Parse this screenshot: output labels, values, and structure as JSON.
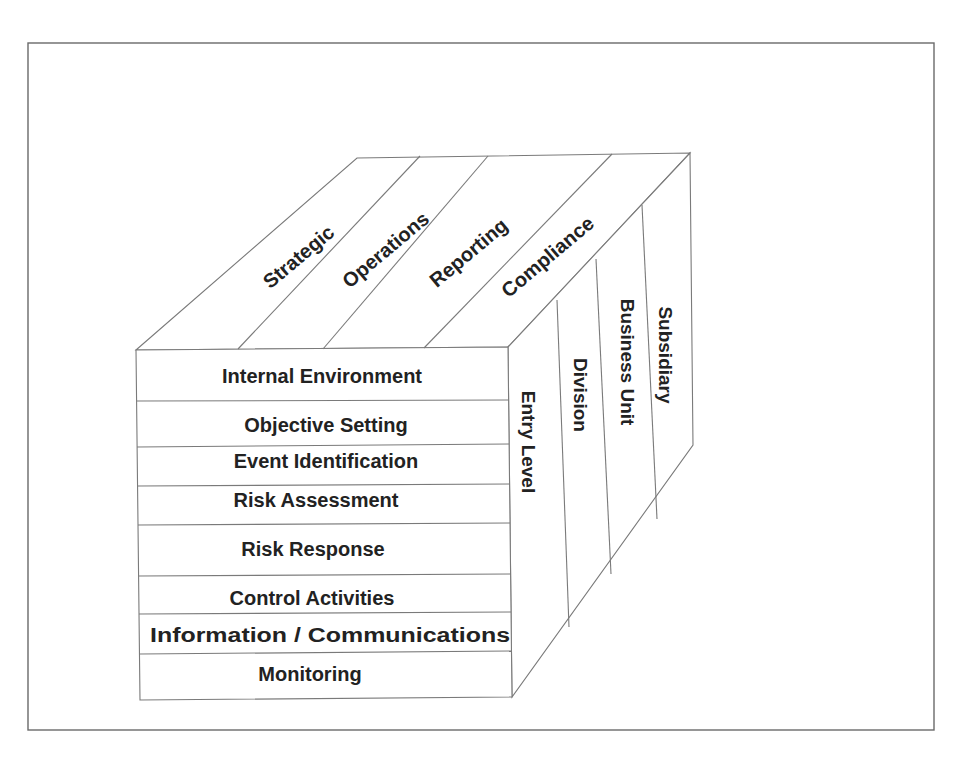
{
  "diagram": {
    "objectives_top_face": [
      {
        "label": "Strategic"
      },
      {
        "label": "Operations"
      },
      {
        "label": "Reporting"
      },
      {
        "label": "Compliance"
      }
    ],
    "components_front_face": [
      {
        "label": "Internal Environment"
      },
      {
        "label": "Objective Setting"
      },
      {
        "label": "Event Identification"
      },
      {
        "label": "Risk Assessment"
      },
      {
        "label": "Risk Response"
      },
      {
        "label": "Control Activities"
      },
      {
        "label": "Information / Communications"
      },
      {
        "label": "Monitoring"
      }
    ],
    "units_side_face": [
      {
        "label": "Entry Level"
      },
      {
        "label": "Division"
      },
      {
        "label": "Business Unit"
      },
      {
        "label": "Subsidiary"
      }
    ],
    "colors": {
      "line": "#7a7a7a",
      "text": "#222222",
      "background": "#ffffff"
    }
  }
}
